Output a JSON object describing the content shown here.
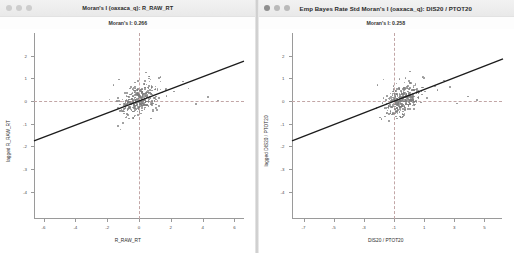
{
  "desktop": {
    "background_color": "#d8d8d8"
  },
  "windows": [
    {
      "id": "left",
      "title": "Moran's I (oaxaca_q): R_RAW_RT",
      "subtitle": "Moran's I: 0.266",
      "traffic_lights": [
        "close-button",
        "minimize-button",
        "zoom-button"
      ],
      "chart_data": {
        "type": "scatter",
        "title": "Moran's I (oaxaca_q): R_RAW_RT",
        "subtitle": "Moran's I: 0.266",
        "xlabel": "R_RAW_RT",
        "ylabel": "lagged R_RAW_RT",
        "xlim": [
          -6.6,
          6.6
        ],
        "ylim": [
          -5.2,
          3.0
        ],
        "xticks": [
          -6,
          -4,
          -2,
          0,
          2,
          4,
          6
        ],
        "yticks": [
          2,
          1,
          0,
          -1,
          -2,
          -3,
          -4
        ],
        "grid": false,
        "reference_lines": {
          "horizontal": 0,
          "vertical": 0,
          "style": "dashed",
          "color": "#c2a6a6"
        },
        "fit_line": {
          "slope": 0.266,
          "intercept": 0.0,
          "color": "#1c1c1c"
        },
        "morans_i": 0.266,
        "point_color": "#7b7b7b",
        "n_points": 330,
        "cluster_center": [
          0.0,
          0.05
        ],
        "cluster_spread": [
          0.62,
          0.33
        ],
        "outliers": [
          [
            2.2,
            0.42
          ],
          [
            3.1,
            0.55
          ],
          [
            4.35,
            0.18
          ],
          [
            4.95,
            0.02
          ],
          [
            3.6,
            -0.12
          ],
          [
            -1.6,
            0.72
          ],
          [
            -1.25,
            0.95
          ],
          [
            1.35,
            1.05
          ],
          [
            0.45,
            1.25
          ],
          [
            2.75,
            0.86
          ]
        ]
      }
    },
    {
      "id": "right",
      "title": "Emp Bayes Rate Std Moran's I (oaxaca_q): DIS20 / PTOT20",
      "subtitle": "Moran's I: 0.258",
      "traffic_lights": [
        "close-button",
        "minimize-button",
        "zoom-button"
      ],
      "chart_data": {
        "type": "scatter",
        "title": "Emp Bayes Rate Std Moran's I (oaxaca_q): DIS20 / PTOT20",
        "subtitle": "Moran's I: 0.258",
        "xlabel": "DIS20 / PTOT20",
        "ylabel": "lagged DIS20 / PTOT20",
        "xlim": [
          -7.8,
          6.2
        ],
        "ylim": [
          -5.2,
          3.0
        ],
        "xticks": [
          -7,
          -5,
          -3,
          -1,
          1,
          3,
          5
        ],
        "yticks": [
          2,
          1,
          0,
          -1,
          -2,
          -3,
          -4
        ],
        "grid": false,
        "reference_lines": {
          "horizontal": 0,
          "vertical": -1,
          "style": "dashed",
          "color": "#c2a6a6"
        },
        "fit_line": {
          "slope": 0.258,
          "intercept": 0.26,
          "color": "#1c1c1c"
        },
        "morans_i": 0.258,
        "point_color": "#7b7b7b",
        "n_points": 330,
        "cluster_center": [
          -0.45,
          0.05
        ],
        "cluster_spread": [
          0.62,
          0.33
        ],
        "outliers": [
          [
            1.9,
            0.5
          ],
          [
            2.7,
            0.62
          ],
          [
            3.9,
            0.2
          ],
          [
            4.5,
            0.05
          ],
          [
            3.2,
            -0.1
          ],
          [
            -2.1,
            0.7
          ],
          [
            -1.7,
            0.95
          ],
          [
            0.9,
            1.05
          ],
          [
            0.05,
            1.3
          ],
          [
            2.3,
            0.9
          ]
        ]
      }
    }
  ]
}
